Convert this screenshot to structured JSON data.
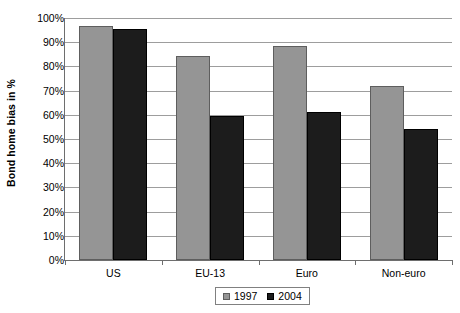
{
  "chart_data": {
    "type": "bar",
    "title": "",
    "subtitle": "",
    "xlabel": "",
    "ylabel": "Bond home bias in %",
    "categories": [
      "US",
      "EU-13",
      "Euro",
      "Non-euro"
    ],
    "series": [
      {
        "name": "1997",
        "color": "#959595",
        "values": [
          96.5,
          84.5,
          88.5,
          72.0
        ]
      },
      {
        "name": "2004",
        "color": "#1c1c1c",
        "values": [
          95.5,
          59.5,
          61.0,
          54.0
        ]
      }
    ],
    "ylim": [
      0,
      100
    ],
    "y_ticks": [
      "0%",
      "10%",
      "20%",
      "30%",
      "40%",
      "50%",
      "60%",
      "70%",
      "80%",
      "90%",
      "100%"
    ],
    "y_tick_values": [
      0,
      10,
      20,
      30,
      40,
      50,
      60,
      70,
      80,
      90,
      100
    ],
    "grid": true,
    "grid_axis": "y",
    "legend_position": "bottom-center",
    "legend_entries": [
      "1997",
      "2004"
    ]
  }
}
